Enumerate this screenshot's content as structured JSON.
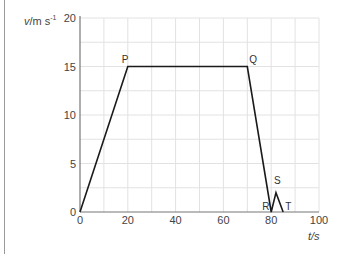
{
  "chart_data": {
    "type": "line",
    "title": "",
    "xlabel": "t/s",
    "ylabel": "v/m s⁻¹",
    "xlim": [
      0,
      100
    ],
    "ylim": [
      0,
      20
    ],
    "x_ticks": [
      0,
      20,
      40,
      60,
      80,
      100
    ],
    "y_ticks": [
      0,
      5,
      10,
      15,
      20
    ],
    "grid": true,
    "series": [
      {
        "name": "velocity-time",
        "x": [
          0,
          20,
          70,
          80,
          82,
          85
        ],
        "values": [
          0,
          15,
          15,
          0,
          2,
          0
        ],
        "color": "#1a1a1a"
      }
    ],
    "annotations": [
      {
        "label": "P",
        "x": 20,
        "y": 15
      },
      {
        "label": "Q",
        "x": 70,
        "y": 15
      },
      {
        "label": "R",
        "x": 80,
        "y": 0
      },
      {
        "label": "S",
        "x": 82,
        "y": 2
      },
      {
        "label": "T",
        "x": 85,
        "y": 0
      }
    ]
  },
  "axis": {
    "ylabel_main": "v",
    "ylabel_unit": "/m s",
    "ylabel_exp": "-1",
    "xlabel": "t/s"
  }
}
